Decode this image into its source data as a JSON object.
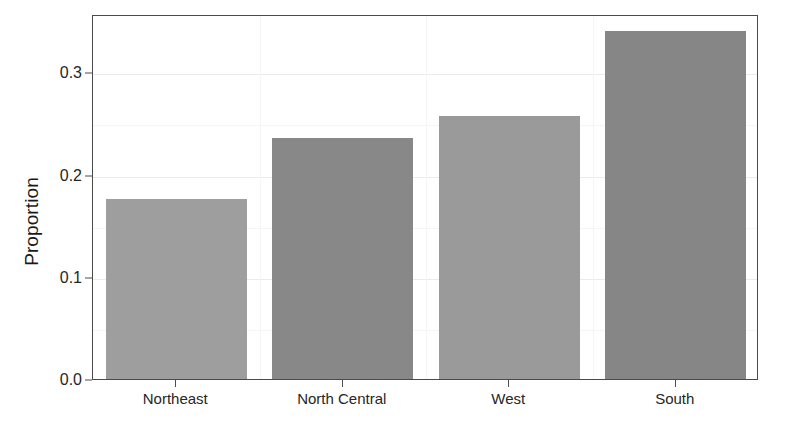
{
  "chart_data": {
    "type": "bar",
    "title": "",
    "subtitle": "",
    "xlabel": "",
    "ylabel": "Proportion",
    "categories": [
      "Northeast",
      "North Central",
      "West",
      "South"
    ],
    "values": [
      0.176,
      0.236,
      0.257,
      0.34
    ],
    "series": [
      {
        "name": "Proportion",
        "values": [
          0.176,
          0.236,
          0.257,
          0.34
        ]
      }
    ],
    "ylim": [
      0.0,
      0.357
    ],
    "xlim": [
      0,
      4
    ],
    "y_ticks": [
      0.0,
      0.1,
      0.2,
      0.3
    ],
    "y_tick_labels": [
      "0.0",
      "0.1",
      "0.2",
      "0.3"
    ],
    "y_minor_ticks": [
      0.05,
      0.15,
      0.25
    ],
    "grid": true,
    "grid_axis": "y",
    "legend": false,
    "legend_position": "none",
    "bar_colors": [
      "#9e9e9e",
      "#888888",
      "#9a9a9a",
      "#868686"
    ],
    "panel_background": "#ffffff",
    "panel_border": "#4a4a4a",
    "gridline_color": "#eceaea",
    "annotations": []
  },
  "axes": {
    "y_title": "Proportion",
    "x_title": ""
  },
  "bars": [
    {
      "label": "Northeast",
      "value": 0.176,
      "color": "#9e9e9e"
    },
    {
      "label": "North Central",
      "value": 0.236,
      "color": "#888888"
    },
    {
      "label": "West",
      "value": 0.257,
      "color": "#9a9a9a"
    },
    {
      "label": "South",
      "value": 0.34,
      "color": "#868686"
    }
  ]
}
